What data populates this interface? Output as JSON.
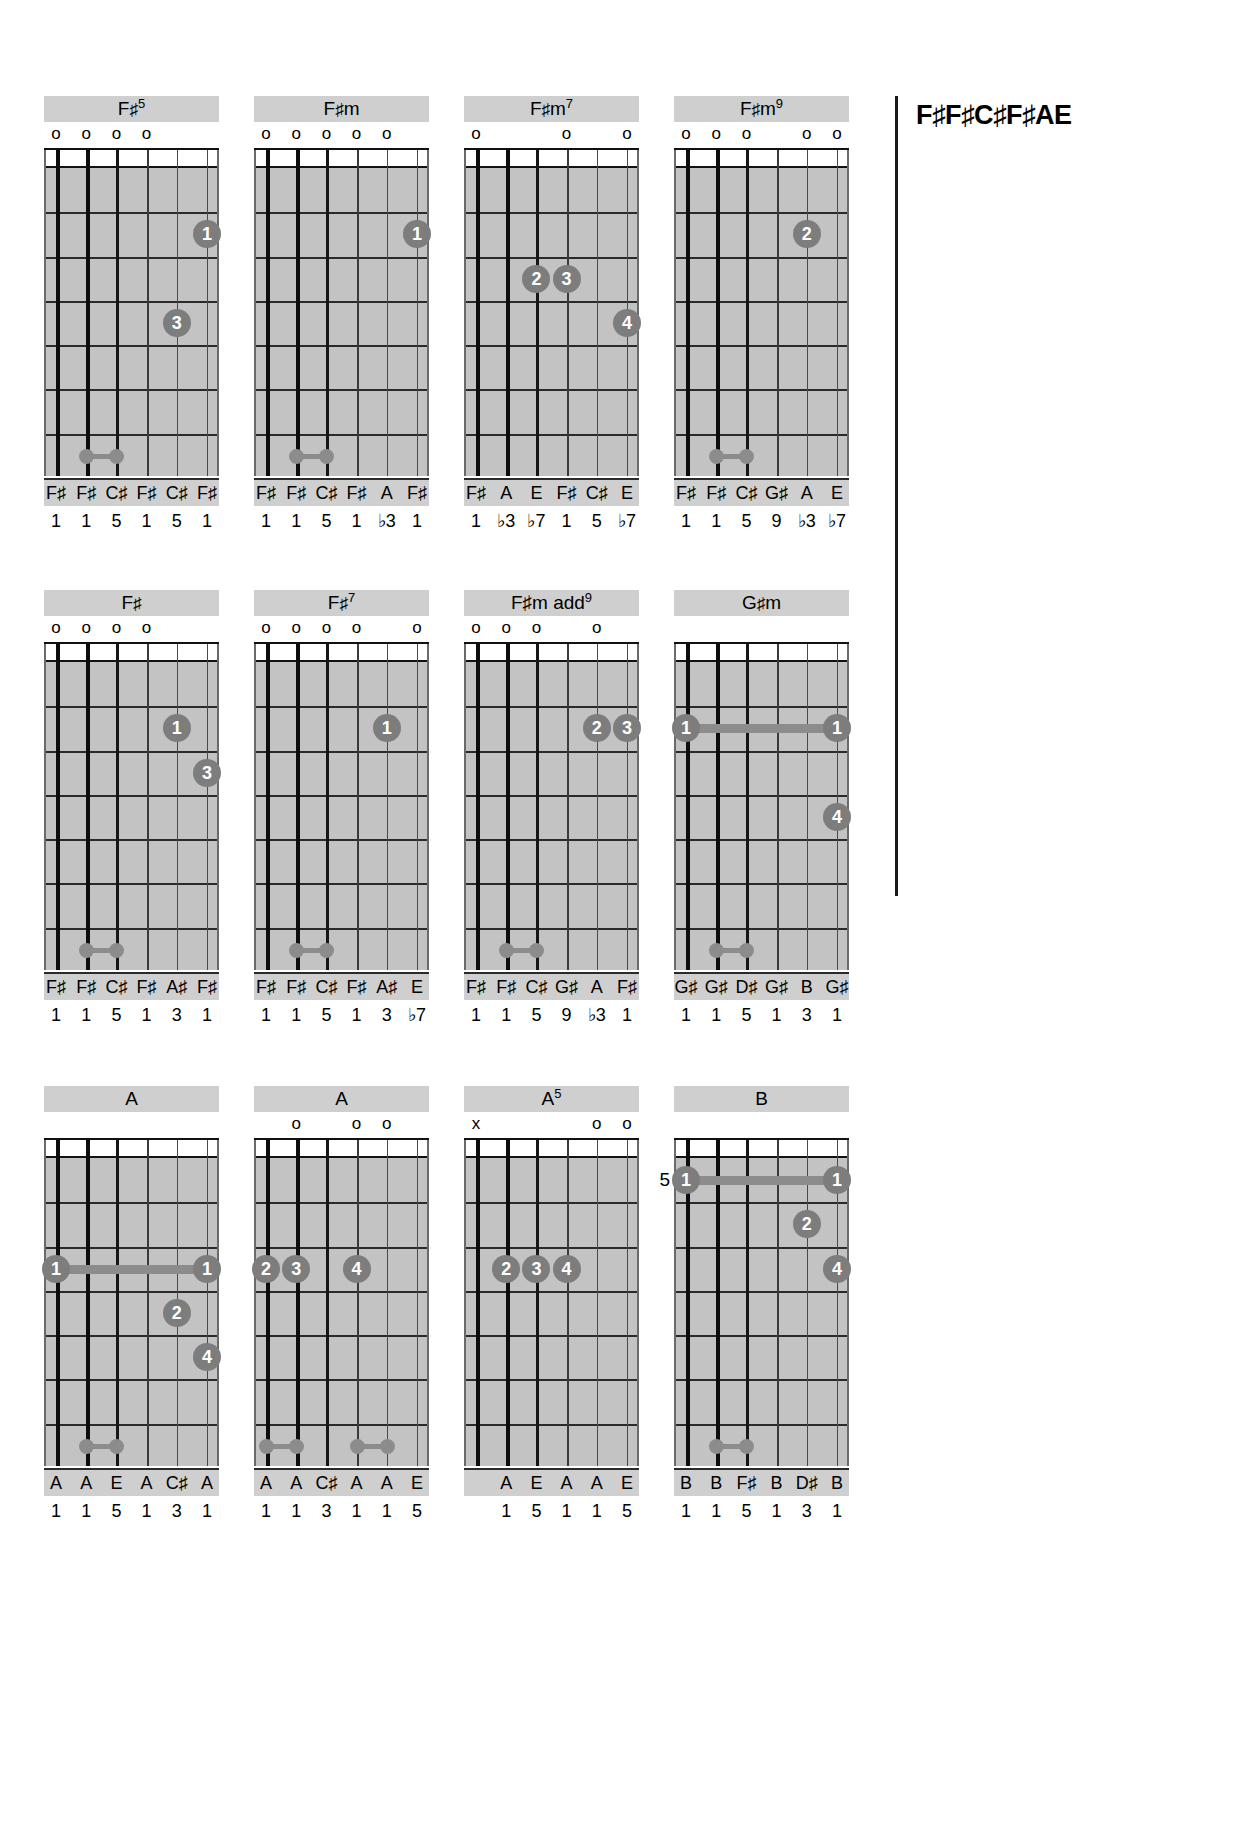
{
  "tuning": {
    "label": "F♯F♯C♯F♯AE"
  },
  "rows": [
    {
      "top": 96,
      "chords": [
        "fsharp5",
        "fsharpm",
        "fsharpm7",
        "fsharpm9"
      ]
    },
    {
      "top": 590,
      "chords": [
        "fsharp",
        "fsharp7",
        "fsharpm_add9",
        "gsharpm"
      ]
    },
    {
      "top": 1086,
      "chords": [
        "a_open",
        "a_second",
        "a5",
        "b_chord"
      ]
    }
  ],
  "chords": {
    "fsharp5": {
      "name": "F♯5",
      "title_main": "F",
      "title_sharp": "♯",
      "title_sup": "5",
      "markers": [
        "o",
        "o",
        "o",
        "o",
        "",
        ""
      ],
      "dots": [
        {
          "string": 5,
          "fret": 2,
          "finger": "1"
        },
        {
          "string": 4,
          "fret": 4,
          "finger": "3"
        }
      ],
      "small_dots": [
        {
          "from": 1,
          "to": 2,
          "fret": 7
        }
      ],
      "notes": [
        "F♯",
        "F♯",
        "C♯",
        "F♯",
        "C♯",
        "F♯"
      ],
      "degrees": [
        "1",
        "1",
        "5",
        "1",
        "5",
        "1"
      ],
      "start_fret": ""
    },
    "fsharpm": {
      "name": "F♯m",
      "title_main": "F",
      "title_sharp": "♯",
      "title_sup": "m",
      "markers": [
        "o",
        "o",
        "o",
        "o",
        "o",
        ""
      ],
      "dots": [
        {
          "string": 5,
          "fret": 2,
          "finger": "1"
        }
      ],
      "small_dots": [
        {
          "from": 1,
          "to": 2,
          "fret": 7
        }
      ],
      "notes": [
        "F♯",
        "F♯",
        "C♯",
        "F♯",
        "A",
        "F♯"
      ],
      "degrees": [
        "1",
        "1",
        "5",
        "1",
        "♭3",
        "1"
      ],
      "start_fret": ""
    },
    "fsharpm7": {
      "name": "F♯m7",
      "title_main": "F",
      "title_sharp": "♯",
      "title_sup": "m7",
      "markers": [
        "o",
        "",
        "",
        "o",
        "",
        "o"
      ],
      "dots": [
        {
          "string": 2,
          "fret": 3,
          "finger": "2"
        },
        {
          "string": 3,
          "fret": 3,
          "finger": "3"
        },
        {
          "string": 5,
          "fret": 4,
          "finger": "4"
        }
      ],
      "small_dots": [],
      "notes": [
        "F♯",
        "A",
        "E",
        "F♯",
        "C♯",
        "E"
      ],
      "degrees": [
        "1",
        "♭3",
        "♭7",
        "1",
        "5",
        "♭7"
      ],
      "start_fret": ""
    },
    "fsharpm9": {
      "name": "F♯m9",
      "title_main": "F",
      "title_sharp": "♯",
      "title_sup": "m9",
      "markers": [
        "o",
        "o",
        "o",
        "",
        "o",
        "o"
      ],
      "dots": [
        {
          "string": 4,
          "fret": 2,
          "finger": "2"
        }
      ],
      "small_dots": [
        {
          "from": 1,
          "to": 2,
          "fret": 7
        }
      ],
      "notes": [
        "F♯",
        "F♯",
        "C♯",
        "G♯",
        "A",
        "E"
      ],
      "degrees": [
        "1",
        "1",
        "5",
        "9",
        "♭3",
        "♭7"
      ],
      "start_fret": ""
    },
    "fsharp": {
      "name": "F♯",
      "title_main": "F",
      "title_sharp": "♯",
      "title_sup": "",
      "markers": [
        "o",
        "o",
        "o",
        "o",
        "",
        ""
      ],
      "dots": [
        {
          "string": 4,
          "fret": 2,
          "finger": "1"
        },
        {
          "string": 5,
          "fret": 3,
          "finger": "3"
        }
      ],
      "small_dots": [
        {
          "from": 1,
          "to": 2,
          "fret": 7
        }
      ],
      "notes": [
        "F♯",
        "F♯",
        "C♯",
        "F♯",
        "A♯",
        "F♯"
      ],
      "degrees": [
        "1",
        "1",
        "5",
        "1",
        "3",
        "1"
      ],
      "start_fret": ""
    },
    "fsharp7": {
      "name": "F♯7",
      "title_main": "F",
      "title_sharp": "♯",
      "title_sup": "7",
      "markers": [
        "o",
        "o",
        "o",
        "o",
        "",
        "o"
      ],
      "dots": [
        {
          "string": 4,
          "fret": 2,
          "finger": "1"
        }
      ],
      "small_dots": [
        {
          "from": 1,
          "to": 2,
          "fret": 7
        }
      ],
      "notes": [
        "F♯",
        "F♯",
        "C♯",
        "F♯",
        "A♯",
        "E"
      ],
      "degrees": [
        "1",
        "1",
        "5",
        "1",
        "3",
        "♭7"
      ],
      "start_fret": ""
    },
    "fsharpm_add9": {
      "name": "F♯m add9",
      "title_main": "F♯m add",
      "title_sharp": "",
      "title_sup": "9",
      "markers": [
        "o",
        "o",
        "o",
        "",
        "o",
        ""
      ],
      "dots": [
        {
          "string": 4,
          "fret": 2,
          "finger": "2"
        },
        {
          "string": 5,
          "fret": 2,
          "finger": "3"
        }
      ],
      "small_dots": [
        {
          "from": 1,
          "to": 2,
          "fret": 7
        }
      ],
      "notes": [
        "F♯",
        "F♯",
        "C♯",
        "G♯",
        "A",
        "F♯"
      ],
      "degrees": [
        "1",
        "1",
        "5",
        "9",
        "♭3",
        "1"
      ],
      "start_fret": ""
    },
    "gsharpm": {
      "name": "G♯m",
      "title_main": "G",
      "title_sharp": "♯",
      "title_sup": "m",
      "markers": [
        "",
        "",
        "",
        "",
        "",
        ""
      ],
      "dots": [
        {
          "string": 0,
          "fret": 2,
          "finger": "1"
        },
        {
          "string": 5,
          "fret": 2,
          "finger": "1"
        },
        {
          "string": 5,
          "fret": 4,
          "finger": "4"
        }
      ],
      "barres": [
        {
          "from": 0,
          "to": 5,
          "fret": 2
        }
      ],
      "small_dots": [
        {
          "from": 1,
          "to": 2,
          "fret": 7
        }
      ],
      "notes": [
        "G♯",
        "G♯",
        "D♯",
        "G♯",
        "B",
        "G♯"
      ],
      "degrees": [
        "1",
        "1",
        "5",
        "1",
        "3",
        "1"
      ],
      "start_fret": ""
    },
    "a_open": {
      "name": "A",
      "title_main": "A",
      "title_sharp": "",
      "title_sup": "",
      "markers": [
        "",
        "",
        "",
        "",
        "",
        ""
      ],
      "dots": [
        {
          "string": 0,
          "fret": 3,
          "finger": "1"
        },
        {
          "string": 5,
          "fret": 3,
          "finger": "1"
        },
        {
          "string": 4,
          "fret": 4,
          "finger": "2"
        },
        {
          "string": 5,
          "fret": 5,
          "finger": "4"
        }
      ],
      "barres": [
        {
          "from": 0,
          "to": 5,
          "fret": 3
        }
      ],
      "small_dots": [
        {
          "from": 1,
          "to": 2,
          "fret": 7
        }
      ],
      "notes": [
        "A",
        "A",
        "E",
        "A",
        "C♯",
        "A"
      ],
      "degrees": [
        "1",
        "1",
        "5",
        "1",
        "3",
        "1"
      ],
      "start_fret": ""
    },
    "a_second": {
      "name": "A",
      "title_main": "A",
      "title_sharp": "",
      "title_sup": "",
      "markers": [
        "",
        "o",
        "",
        "o",
        "o",
        ""
      ],
      "dots": [
        {
          "string": 0,
          "fret": 3,
          "finger": "2"
        },
        {
          "string": 1,
          "fret": 3,
          "finger": "3"
        },
        {
          "string": 3,
          "fret": 3,
          "finger": "4"
        }
      ],
      "small_dots": [
        {
          "from": 0,
          "to": 1,
          "fret": 7
        },
        {
          "from": 3,
          "to": 4,
          "fret": 7
        }
      ],
      "notes": [
        "A",
        "A",
        "C♯",
        "A",
        "A",
        "E"
      ],
      "degrees": [
        "1",
        "1",
        "3",
        "1",
        "1",
        "5"
      ],
      "start_fret": ""
    },
    "a5": {
      "name": "A5",
      "title_main": "A",
      "title_sharp": "",
      "title_sup": "5",
      "markers": [
        "x",
        "",
        "",
        "",
        "o",
        "o"
      ],
      "dots": [
        {
          "string": 1,
          "fret": 3,
          "finger": "2"
        },
        {
          "string": 2,
          "fret": 3,
          "finger": "3"
        },
        {
          "string": 3,
          "fret": 3,
          "finger": "4"
        }
      ],
      "small_dots": [],
      "notes": [
        "",
        "A",
        "E",
        "A",
        "A",
        "E"
      ],
      "degrees": [
        "",
        "1",
        "5",
        "1",
        "1",
        "5"
      ],
      "start_fret": ""
    },
    "b_chord": {
      "name": "B",
      "title_main": "B",
      "title_sharp": "",
      "title_sup": "",
      "markers": [
        "",
        "",
        "",
        "",
        "",
        ""
      ],
      "dots": [
        {
          "string": 0,
          "fret": 1,
          "finger": "1"
        },
        {
          "string": 5,
          "fret": 1,
          "finger": "1"
        },
        {
          "string": 4,
          "fret": 2,
          "finger": "2"
        },
        {
          "string": 5,
          "fret": 3,
          "finger": "4"
        }
      ],
      "barres": [
        {
          "from": 0,
          "to": 5,
          "fret": 1
        }
      ],
      "small_dots": [
        {
          "from": 1,
          "to": 2,
          "fret": 7
        }
      ],
      "notes": [
        "B",
        "B",
        "F♯",
        "B",
        "D♯",
        "B"
      ],
      "degrees": [
        "1",
        "1",
        "5",
        "1",
        "3",
        "1"
      ],
      "start_fret": "5"
    }
  }
}
